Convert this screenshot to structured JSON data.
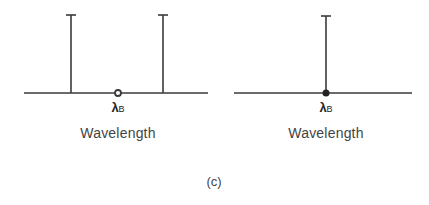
{
  "figure": {
    "caption": "(c)",
    "line_color": "#3a3a3a"
  },
  "panels": [
    {
      "id": "left",
      "axis_label": "Wavelength",
      "center_symbol": "λ",
      "center_subscript": "B",
      "center_marker": "open-circle",
      "lines": [
        {
          "position": "left-of-center"
        },
        {
          "position": "right-of-center"
        }
      ]
    },
    {
      "id": "right",
      "axis_label": "Wavelength",
      "center_symbol": "λ",
      "center_subscript": "B",
      "center_marker": "filled-circle",
      "lines": [
        {
          "position": "at-center"
        }
      ]
    }
  ]
}
